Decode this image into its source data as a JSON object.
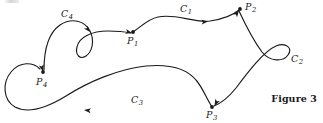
{
  "figure": {
    "caption": "Figure 3",
    "background_color": "#ffffff",
    "ink_color": "#1a1a1a",
    "width": 323,
    "height": 123
  },
  "points": [
    {
      "id": "P1",
      "label": "P",
      "subscript": "1",
      "x": 133,
      "y": 32,
      "label_x": 128,
      "label_y": 37,
      "has_dot": true
    },
    {
      "id": "P2",
      "label": "P",
      "subscript": "2",
      "x": 240,
      "y": 9,
      "label_x": 244,
      "label_y": 2,
      "has_dot": true
    },
    {
      "id": "P3",
      "label": "P",
      "subscript": "3",
      "x": 212,
      "y": 108,
      "label_x": 207,
      "label_y": 110,
      "has_dot": true
    },
    {
      "id": "P4",
      "label": "P",
      "subscript": "4",
      "x": 43,
      "y": 73,
      "label_x": 36,
      "label_y": 78,
      "has_dot": true
    }
  ],
  "curves": [
    {
      "id": "C1",
      "label": "P1 to P2",
      "label_text": "C",
      "subscript": "1",
      "label_x": 181,
      "label_y": 5,
      "from": "P1",
      "to": "P2"
    },
    {
      "id": "C2",
      "label": "P2 to P3 with loop",
      "label_text": "C",
      "subscript": "2",
      "label_x": 292,
      "label_y": 56,
      "from": "P2",
      "to": "P3"
    },
    {
      "id": "C3",
      "label": "P3 to P4",
      "label_text": "C",
      "subscript": "3",
      "label_x": 133,
      "label_y": 96,
      "from": "P3",
      "to": "P4"
    },
    {
      "id": "C4",
      "label": "P4 to P1 with loop",
      "label_text": "C",
      "subscript": "4",
      "label_x": 62,
      "label_y": 10,
      "from": "P4",
      "to": "P1"
    }
  ],
  "arrow_markers": [
    {
      "id": "arrow-c1-mid",
      "on_curve": "C1",
      "x": 204,
      "y": 22,
      "angle": 12
    },
    {
      "id": "arrow-c1-end",
      "on_curve": "C1",
      "x": 238,
      "y": 11,
      "angle": -60
    },
    {
      "id": "arrow-c2-end",
      "on_curve": "C2",
      "x": 214,
      "y": 105,
      "angle": 122
    },
    {
      "id": "arrow-c3-mid",
      "on_curve": "C3",
      "x": 92,
      "y": 109,
      "angle": 190
    },
    {
      "id": "arrow-c4-mid",
      "on_curve": "C4",
      "x": 89,
      "y": 33,
      "angle": 58
    },
    {
      "id": "arrow-c4-end",
      "on_curve": "C4",
      "x": 131,
      "y": 33,
      "angle": 20
    },
    {
      "id": "arrow-p4-end",
      "on_curve": "C3",
      "x": 44,
      "y": 71,
      "angle": 78
    }
  ]
}
